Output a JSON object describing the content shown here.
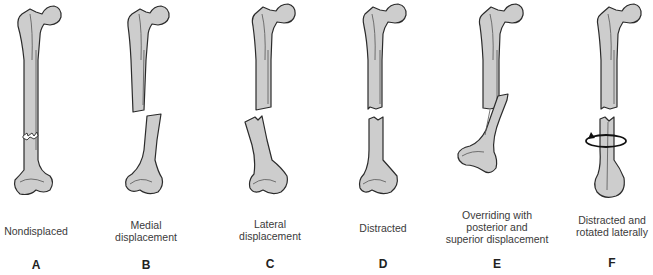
{
  "figure": {
    "panels": [
      {
        "letter": "A",
        "caption_lines": [
          "Nondisplaced"
        ],
        "center_x": 36
      },
      {
        "letter": "B",
        "caption_lines": [
          "Medial",
          "displacement"
        ],
        "center_x": 146
      },
      {
        "letter": "C",
        "caption_lines": [
          "Lateral",
          "displacement"
        ],
        "center_x": 270
      },
      {
        "letter": "D",
        "caption_lines": [
          "Distracted"
        ],
        "center_x": 383
      },
      {
        "letter": "E",
        "caption_lines": [
          "Overriding with",
          "posterior and",
          "superior displacement"
        ],
        "center_x": 497
      },
      {
        "letter": "F",
        "caption_lines": [
          "Distracted and",
          "rotated laterally"
        ],
        "center_x": 612
      }
    ],
    "colors": {
      "bone_fill": "#cdcdcd",
      "bone_outline": "#2b2b2b",
      "text": "#3a3a3a"
    }
  }
}
